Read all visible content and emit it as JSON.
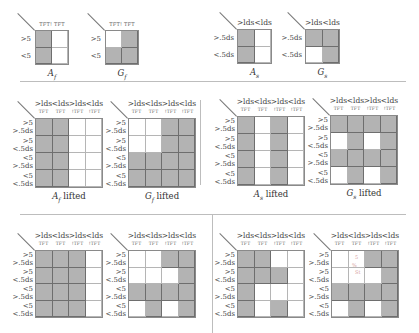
{
  "labels": {
    "col_ds_gt": ">lds",
    "col_ds_lt": "<lds",
    "sub_tft": "TFT",
    "sub_ntft": "!TFT",
    "top_f_sub": "TFT! TFT",
    "row_gt5": ">5",
    "row_lt5": "<5",
    "row_gt5ds": ">.5ds",
    "row_lt5ds": "<.5ds",
    "lifted": "lifted"
  },
  "panels": {
    "Af": {
      "caption_sym": "A",
      "caption_sub": "f",
      "caption_suffix": "",
      "cells": [
        [
          1,
          0
        ],
        [
          1,
          0
        ]
      ]
    },
    "Gf": {
      "caption_sym": "G",
      "caption_sub": "f",
      "caption_suffix": "",
      "cells": [
        [
          0,
          1
        ],
        [
          1,
          1
        ]
      ]
    },
    "As": {
      "caption_sym": "A",
      "caption_sub": "s",
      "caption_suffix": "",
      "cells": [
        [
          1,
          0
        ],
        [
          1,
          0
        ]
      ]
    },
    "Gs": {
      "caption_sym": "G",
      "caption_sub": "s",
      "caption_suffix": "",
      "cells": [
        [
          1,
          1
        ],
        [
          0,
          1
        ]
      ]
    },
    "Af_lifted": {
      "caption_sym": "A",
      "caption_sub": "f",
      "caption_suffix": " lifted",
      "cells": [
        [
          1,
          1,
          0,
          0
        ],
        [
          1,
          1,
          0,
          0
        ],
        [
          1,
          1,
          0,
          0
        ],
        [
          1,
          1,
          0,
          0
        ]
      ]
    },
    "Gf_lifted": {
      "caption_sym": "G",
      "caption_sub": "f",
      "caption_suffix": " lifted",
      "cells": [
        [
          0,
          0,
          1,
          1
        ],
        [
          0,
          0,
          1,
          1
        ],
        [
          1,
          1,
          1,
          1
        ],
        [
          1,
          1,
          1,
          1
        ]
      ]
    },
    "As_lifted": {
      "caption_sym": "A",
      "caption_sub": "s",
      "caption_suffix": " lifted",
      "cells": [
        [
          1,
          0,
          1,
          0
        ],
        [
          1,
          0,
          1,
          0
        ],
        [
          1,
          0,
          1,
          0
        ],
        [
          1,
          0,
          1,
          0
        ]
      ]
    },
    "Gs_lifted": {
      "caption_sym": "G",
      "caption_sub": "s",
      "caption_suffix": " lifted",
      "cells": [
        [
          1,
          1,
          1,
          1
        ],
        [
          0,
          1,
          0,
          1
        ],
        [
          1,
          1,
          1,
          1
        ],
        [
          0,
          1,
          0,
          1
        ]
      ]
    },
    "bottom_l1": {
      "cells": [
        [
          1,
          1,
          1,
          0
        ],
        [
          1,
          1,
          1,
          0
        ],
        [
          1,
          1,
          1,
          0
        ],
        [
          1,
          1,
          1,
          0
        ]
      ]
    },
    "bottom_l2": {
      "cells": [
        [
          0,
          0,
          1,
          1
        ],
        [
          0,
          0,
          0,
          1
        ],
        [
          1,
          1,
          1,
          1
        ],
        [
          0,
          1,
          0,
          1
        ]
      ]
    },
    "bottom_r1": {
      "cells": [
        [
          1,
          1,
          0,
          0
        ],
        [
          1,
          1,
          1,
          0
        ],
        [
          1,
          0,
          0,
          0
        ],
        [
          1,
          0,
          1,
          0
        ]
      ]
    },
    "bottom_r2": {
      "cells": [
        [
          0,
          0,
          1,
          1
        ],
        [
          0,
          0,
          0,
          1
        ],
        [
          1,
          1,
          1,
          1
        ],
        [
          0,
          1,
          0,
          1
        ]
      ]
    }
  },
  "colors": {
    "shaded": "#b3b3b3",
    "grid_line": "#6e6e6e",
    "divider": "#bdbdbd"
  },
  "annotations": {
    "pen_marks": [
      "5",
      "%",
      "St"
    ]
  }
}
